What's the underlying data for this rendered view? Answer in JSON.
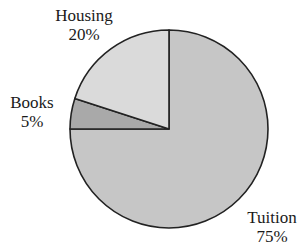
{
  "chart_data": {
    "type": "pie",
    "title": "",
    "categories": [
      "Tuition",
      "Books",
      "Housing"
    ],
    "values": [
      75,
      5,
      20
    ],
    "value_labels": [
      "75%",
      "5%",
      "20%"
    ],
    "colors": [
      "#c6c6c6",
      "#a9a9a9",
      "#dadada"
    ],
    "start_angle_deg": 0,
    "direction": "clockwise-from-top",
    "legend": "none (direct labels)"
  },
  "labels": {
    "housing": {
      "name": "Housing",
      "pct": "20%"
    },
    "books": {
      "name": "Books",
      "pct": "5%"
    },
    "tuition": {
      "name": "Tuition",
      "pct": "75%"
    }
  },
  "colors": {
    "stroke": "#222222",
    "background": "#ffffff"
  }
}
